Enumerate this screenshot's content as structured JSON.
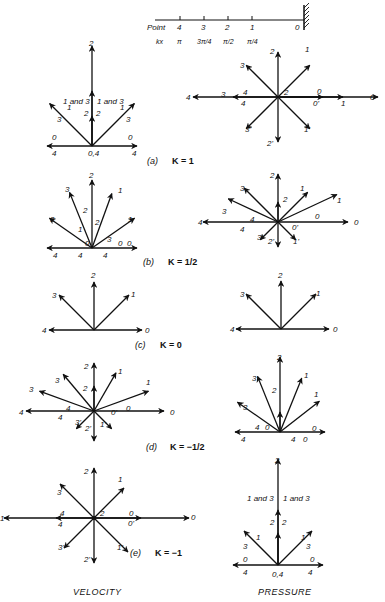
{
  "header_scale": {
    "point_label": "Point",
    "kx_label": "kx",
    "points": [
      "4",
      "3",
      "2",
      "1",
      "0"
    ],
    "kx_values": [
      "π",
      "3π/4",
      "π/2",
      "π/4",
      ""
    ]
  },
  "panels": [
    {
      "id": "a",
      "caption_letter": "(a)",
      "caption_k": "K = 1",
      "velocity": {
        "arrows": [
          {
            "label": "0",
            "angle": 0,
            "len": 1.0
          },
          {
            "label": "1",
            "angle": 45,
            "len": 1.0
          },
          {
            "label": "2",
            "angle": 90,
            "len": 1.41
          },
          {
            "label": "3",
            "angle": 135,
            "len": 1.0
          },
          {
            "label": "4",
            "angle": 180,
            "len": 1.0
          }
        ],
        "inner_labels": [
          "1 and 3",
          "1 and 3",
          "2",
          "2",
          "0,4"
        ],
        "tip_labels": [
          "2",
          "1",
          "3",
          "1",
          "3",
          "0",
          "4",
          "0",
          "4"
        ]
      },
      "pressure": {
        "arrows": [
          {
            "label": "0",
            "angle": 0,
            "len": 1.0
          },
          {
            "label": "1",
            "angle": 45,
            "len": 1.0
          },
          {
            "label": "2",
            "angle": 90,
            "len": 1.0
          },
          {
            "label": "3",
            "angle": 135,
            "len": 1.0
          },
          {
            "label": "4",
            "angle": 180,
            "len": 1.0
          },
          {
            "label": "3'",
            "angle": 225,
            "len": 1.0
          },
          {
            "label": "2'",
            "angle": 270,
            "len": 1.0
          },
          {
            "label": "1'",
            "angle": 315,
            "len": 1.0
          }
        ],
        "extra_labels": [
          "2",
          "3",
          "4",
          "4",
          "0",
          "0'",
          "1",
          "0"
        ]
      }
    },
    {
      "id": "b",
      "caption_letter": "(b)",
      "caption_k": "K = 1/2",
      "velocity_labels": [
        "2",
        "3",
        "1",
        "2",
        "3",
        "1",
        "2",
        "1",
        "3",
        "0",
        "0",
        "0",
        "4",
        "4",
        "4"
      ],
      "pressure_labels": [
        "2",
        "3",
        "1",
        "2",
        "3",
        "1",
        "4",
        "4",
        "0",
        "0",
        "0'",
        "3'",
        "2'",
        "1'",
        "4"
      ]
    },
    {
      "id": "c",
      "caption_letter": "(c)",
      "caption_k": "K = 0",
      "velocity_labels": [
        "2",
        "3",
        "1",
        "4",
        "0"
      ],
      "pressure_labels": [
        "2",
        "3",
        "1",
        "4",
        "0"
      ]
    },
    {
      "id": "d",
      "caption_letter": "(d)",
      "caption_k": "K = −1/2",
      "velocity_labels": [
        "2",
        "3",
        "1",
        "2",
        "3",
        "1",
        "4",
        "4",
        "0",
        "0",
        "0'",
        "3'",
        "2'",
        "1'",
        "4"
      ],
      "pressure_labels": [
        "2",
        "3",
        "1",
        "2",
        "3",
        "1",
        "4",
        "0",
        "4",
        "0",
        "0",
        "4"
      ]
    },
    {
      "id": "e",
      "caption_letter": "(e)",
      "caption_k": "K = −1",
      "velocity_labels": [
        "2",
        "1",
        "3",
        "4",
        "4",
        "2",
        "0",
        "0'",
        "0",
        "3'",
        "2'",
        "1'",
        "1"
      ],
      "pressure_labels": [
        "2",
        "1 and 3",
        "1 and 3",
        "2",
        "2",
        "1",
        "3",
        "3",
        "1",
        "0",
        "0",
        "4",
        "0,4",
        "4"
      ]
    }
  ],
  "footer": {
    "left": "VELOCITY",
    "right": "PRESSURE"
  }
}
